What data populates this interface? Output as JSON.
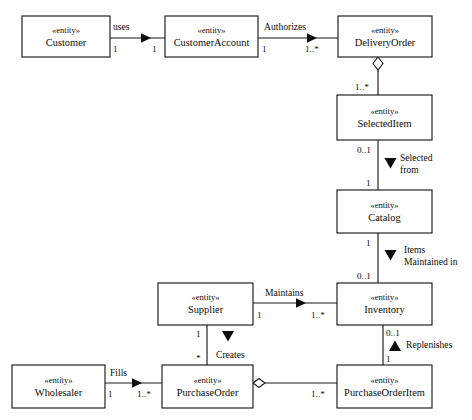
{
  "diagram": {
    "kind": "uml-entity-class-diagram",
    "stereotype": "«entity»",
    "canvas": {
      "width": 472,
      "height": 420
    },
    "colors": {
      "background": "#ffffff",
      "stroke": "#1a1a1a",
      "text": "#0d0d0d",
      "box_fill": "#ffffff"
    },
    "entities": [
      {
        "id": "customer",
        "name": "Customer",
        "x": 22,
        "y": 16,
        "w": 88,
        "h": 41
      },
      {
        "id": "customeraccount",
        "name": "CustomerAccount",
        "x": 165,
        "y": 16,
        "w": 93,
        "h": 41
      },
      {
        "id": "deliveryorder",
        "name": "DeliveryOrder",
        "x": 338,
        "y": 16,
        "w": 94,
        "h": 41
      },
      {
        "id": "selecteditem",
        "name": "SelectedItem",
        "x": 337,
        "y": 95,
        "w": 95,
        "h": 45
      },
      {
        "id": "catalog",
        "name": "Catalog",
        "x": 337,
        "y": 190,
        "w": 95,
        "h": 43
      },
      {
        "id": "inventory",
        "name": "Inventory",
        "x": 337,
        "y": 283,
        "w": 95,
        "h": 42
      },
      {
        "id": "supplier",
        "name": "Supplier",
        "x": 158,
        "y": 283,
        "w": 95,
        "h": 42
      },
      {
        "id": "wholesaler",
        "name": "Wholesaler",
        "x": 12,
        "y": 365,
        "w": 93,
        "h": 43
      },
      {
        "id": "purchaseorder",
        "name": "PurchaseOrder",
        "x": 162,
        "y": 365,
        "w": 91,
        "h": 43
      },
      {
        "id": "purchaseorderitem",
        "name": "PurchaseOrderItem",
        "x": 337,
        "y": 365,
        "w": 95,
        "h": 43
      }
    ],
    "associations": [
      {
        "id": "customer-uses-customeraccount",
        "label": "uses",
        "from": "customer",
        "to": "customeraccount",
        "source_multiplicity": "1",
        "target_multiplicity": "1",
        "navigation": "right"
      },
      {
        "id": "customeraccount-authorizes-deliveryorder",
        "label": "Authorizes",
        "from": "customeraccount",
        "to": "deliveryorder",
        "source_multiplicity": "1",
        "target_multiplicity": "1..*",
        "navigation": "right"
      },
      {
        "id": "deliveryorder-aggregates-selecteditem",
        "label": "",
        "from": "deliveryorder",
        "to": "selecteditem",
        "source_multiplicity": "",
        "target_multiplicity": "1..*",
        "navigation": "none",
        "aggregation": true
      },
      {
        "id": "selecteditem-selectedfrom-catalog",
        "label": "Selected\nfrom",
        "label_line_1": "Selected",
        "label_line_2": "from",
        "from": "selecteditem",
        "to": "catalog",
        "source_multiplicity": "0..1",
        "target_multiplicity": "1",
        "navigation": "down"
      },
      {
        "id": "catalog-itemsmaintainedin-inventory",
        "label": "Items\nMaintained in",
        "label_line_1": "Items",
        "label_line_2": "Maintained in",
        "from": "catalog",
        "to": "inventory",
        "source_multiplicity": "1",
        "target_multiplicity": "0..1",
        "navigation": "down"
      },
      {
        "id": "supplier-maintains-inventory",
        "label": "Maintains",
        "from": "supplier",
        "to": "inventory",
        "source_multiplicity": "1",
        "target_multiplicity": "1..*",
        "navigation": "right"
      },
      {
        "id": "supplier-creates-purchaseorder",
        "label": "Creates",
        "from": "supplier",
        "to": "purchaseorder",
        "source_multiplicity": "1",
        "target_multiplicity": "*",
        "navigation": "down"
      },
      {
        "id": "inventory-replenishes-purchaseorderitem",
        "label": "Replenishes",
        "from": "purchaseorderitem",
        "to": "inventory",
        "source_multiplicity": "0..1",
        "target_multiplicity": "1",
        "navigation": "up"
      },
      {
        "id": "wholesaler-fills-purchaseorder",
        "label": "Fills",
        "from": "wholesaler",
        "to": "purchaseorder",
        "source_multiplicity": "1",
        "target_multiplicity": "1..*",
        "navigation": "right"
      },
      {
        "id": "purchaseorder-aggregates-purchaseorderitem",
        "label": "",
        "from": "purchaseorder",
        "to": "purchaseorderitem",
        "source_multiplicity": "",
        "target_multiplicity": "1..*",
        "navigation": "none",
        "aggregation": true
      }
    ]
  }
}
